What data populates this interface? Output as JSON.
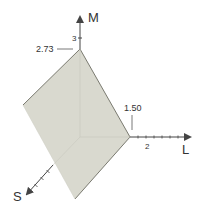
{
  "diagram": {
    "type": "3d-plane-intercepts",
    "axes": {
      "M": {
        "label": "M",
        "tick_label": "3"
      },
      "L": {
        "label": "L",
        "tick_label": "2"
      },
      "S": {
        "label": "S"
      }
    },
    "intercepts": {
      "M": "2.73",
      "L": "1.50"
    },
    "colors": {
      "plane_fill": "#d9d9cf",
      "plane_edge": "#7a7a70",
      "axis": "#444444",
      "text": "#333333"
    }
  }
}
